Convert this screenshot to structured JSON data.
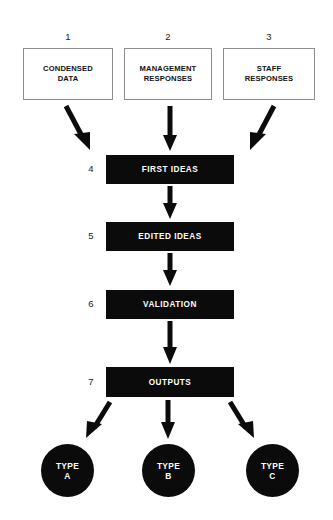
{
  "diagram": {
    "background_color": "#ffffff",
    "fill_color": "#0b0b0b",
    "box_border_color": "#8d8d8d",
    "text_on_dark_color": "#ffffff"
  },
  "inputs": [
    {
      "number": "1",
      "line1": "CONDENSED",
      "line2": "DATA"
    },
    {
      "number": "2",
      "line1": "MANAGEMENT",
      "line2": "RESPONSES"
    },
    {
      "number": "3",
      "line1": "STAFF",
      "line2": "RESPONSES"
    }
  ],
  "stages": [
    {
      "number": "4",
      "label": "FIRST IDEAS"
    },
    {
      "number": "5",
      "label": "EDITED IDEAS"
    },
    {
      "number": "6",
      "label": "VALIDATION"
    },
    {
      "number": "7",
      "label": "OUTPUTS"
    }
  ],
  "outputs": [
    {
      "line1": "TYPE",
      "line2": "A"
    },
    {
      "line1": "TYPE",
      "line2": "B"
    },
    {
      "line1": "TYPE",
      "line2": "C"
    }
  ],
  "connectors": [
    {
      "name": "input-1-to-first-ideas",
      "direction": "down-right"
    },
    {
      "name": "input-2-to-first-ideas",
      "direction": "down"
    },
    {
      "name": "input-3-to-first-ideas",
      "direction": "down-left"
    },
    {
      "name": "first-ideas-to-edited-ideas",
      "direction": "down"
    },
    {
      "name": "edited-ideas-to-validation",
      "direction": "down"
    },
    {
      "name": "validation-to-outputs",
      "direction": "down"
    },
    {
      "name": "outputs-to-type-a",
      "direction": "down-left"
    },
    {
      "name": "outputs-to-type-b",
      "direction": "down"
    },
    {
      "name": "outputs-to-type-c",
      "direction": "down-right"
    }
  ]
}
